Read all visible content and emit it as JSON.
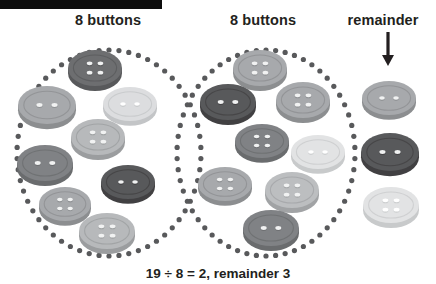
{
  "page": {
    "caption": "19 ÷ 8 = 2, remainder 3",
    "black_bar": "black-bar"
  },
  "headings": [
    {
      "label": "8 buttons",
      "name": "group-1-heading",
      "x": 45,
      "y": 12,
      "w": 126
    },
    {
      "label": "8 buttons",
      "name": "group-2-heading",
      "x": 200,
      "y": 12,
      "w": 126
    },
    {
      "label": "remainder",
      "name": "remainder-heading",
      "x": 330,
      "y": 12,
      "w": 106
    }
  ],
  "groups": [
    {
      "name": "group-1-circle",
      "label": "8 buttons",
      "count": 8,
      "ellipse": {
        "cx": 109,
        "cy": 153,
        "rx": 92,
        "ry": 103,
        "dots": 58,
        "dot_r": 2.6,
        "color": "#58595b"
      }
    },
    {
      "name": "group-2-circle",
      "label": "8 buttons",
      "count": 8,
      "ellipse": {
        "cx": 266,
        "cy": 153,
        "rx": 89,
        "ry": 103,
        "dots": 58,
        "dot_r": 2.6,
        "color": "#58595b"
      }
    }
  ],
  "remainder": {
    "label": "remainder",
    "count": 3,
    "arrow": {
      "x": 388,
      "y": 32,
      "length": 34,
      "color": "#231f20"
    }
  },
  "colors": {
    "ink": "#231f20",
    "dot": "#58595b",
    "background": "#ffffff",
    "bar": "#0d0d0d",
    "button_very_dark": "#58595b",
    "button_dark": "#6d6e70",
    "button_mid": "#808285",
    "button_light": "#a7a9ac",
    "button_lighter": "#bcbec0",
    "button_pale": "#d1d3d4",
    "button_palest": "#e6e7e8"
  },
  "buttons": [
    {
      "id": "b1",
      "group": "group-1",
      "holes": 4,
      "cx": 95,
      "cy": 68,
      "rx": 27,
      "ry": 18,
      "top": "#6d6e70",
      "side": "#58595b",
      "hole": "#f1f2f2"
    },
    {
      "id": "b2",
      "group": "group-1",
      "holes": 2,
      "cx": 47,
      "cy": 105,
      "rx": 29,
      "ry": 19,
      "top": "#a7a9ac",
      "side": "#8c8e90",
      "hole": "#f1f2f2"
    },
    {
      "id": "b3",
      "group": "group-1",
      "holes": 2,
      "cx": 130,
      "cy": 104,
      "rx": 27,
      "ry": 17,
      "top": "#dcdddf",
      "side": "#c3c5c7",
      "hole": "#ffffff"
    },
    {
      "id": "b4",
      "group": "group-1",
      "holes": 4,
      "cx": 98,
      "cy": 137,
      "rx": 27,
      "ry": 18,
      "top": "#b7b9bb",
      "side": "#9b9d9f",
      "hole": "#f1f2f2"
    },
    {
      "id": "b5",
      "group": "group-1",
      "holes": 2,
      "cx": 45,
      "cy": 163,
      "rx": 28,
      "ry": 18,
      "top": "#808285",
      "side": "#6a6c6e",
      "hole": "#f1f2f2"
    },
    {
      "id": "b6",
      "group": "group-1",
      "holes": 2,
      "cx": 128,
      "cy": 182,
      "rx": 27,
      "ry": 17,
      "top": "#58595b",
      "side": "#414042",
      "hole": "#f1f2f2"
    },
    {
      "id": "b7",
      "group": "group-1",
      "holes": 4,
      "cx": 65,
      "cy": 204,
      "rx": 26,
      "ry": 17,
      "top": "#a7a9ac",
      "side": "#8c8e90",
      "hole": "#f1f2f2"
    },
    {
      "id": "b8",
      "group": "group-1",
      "holes": 4,
      "cx": 107,
      "cy": 231,
      "rx": 28,
      "ry": 18,
      "top": "#b7b9bb",
      "side": "#9b9d9f",
      "hole": "#f1f2f2"
    },
    {
      "id": "b9",
      "group": "group-2",
      "holes": 4,
      "cx": 260,
      "cy": 68,
      "rx": 27,
      "ry": 18,
      "top": "#a7a9ac",
      "side": "#8c8e90",
      "hole": "#f1f2f2"
    },
    {
      "id": "b10",
      "group": "group-2",
      "holes": 2,
      "cx": 228,
      "cy": 102,
      "rx": 28,
      "ry": 18,
      "top": "#58595b",
      "side": "#414042",
      "hole": "#f1f2f2"
    },
    {
      "id": "b11",
      "group": "group-2",
      "holes": 4,
      "cx": 303,
      "cy": 100,
      "rx": 27,
      "ry": 18,
      "top": "#a7a9ac",
      "side": "#8c8e90",
      "hole": "#f1f2f2"
    },
    {
      "id": "b12",
      "group": "group-2",
      "holes": 4,
      "cx": 262,
      "cy": 141,
      "rx": 27,
      "ry": 17,
      "top": "#808285",
      "side": "#6a6c6e",
      "hole": "#f1f2f2"
    },
    {
      "id": "b13",
      "group": "group-2",
      "holes": 2,
      "cx": 318,
      "cy": 152,
      "rx": 27,
      "ry": 17,
      "top": "#e2e3e4",
      "side": "#c8cacb",
      "hole": "#ffffff"
    },
    {
      "id": "b14",
      "group": "group-2",
      "holes": 4,
      "cx": 225,
      "cy": 184,
      "rx": 27,
      "ry": 17,
      "top": "#a7a9ac",
      "side": "#8c8e90",
      "hole": "#f1f2f2"
    },
    {
      "id": "b15",
      "group": "group-2",
      "holes": 4,
      "cx": 292,
      "cy": 190,
      "rx": 27,
      "ry": 18,
      "top": "#bcbec0",
      "side": "#a1a3a5",
      "hole": "#f1f2f2"
    },
    {
      "id": "b16",
      "group": "group-2",
      "holes": 2,
      "cx": 271,
      "cy": 228,
      "rx": 28,
      "ry": 18,
      "top": "#808285",
      "side": "#6a6c6e",
      "hole": "#f1f2f2"
    },
    {
      "id": "b17",
      "group": "remainder",
      "holes": 2,
      "cx": 389,
      "cy": 98,
      "rx": 27,
      "ry": 17,
      "top": "#a7a9ac",
      "side": "#8c8e90",
      "hole": "#f1f2f2"
    },
    {
      "id": "b18",
      "group": "remainder",
      "holes": 2,
      "cx": 390,
      "cy": 152,
      "rx": 29,
      "ry": 19,
      "top": "#58595b",
      "side": "#414042",
      "hole": "#f1f2f2"
    },
    {
      "id": "b19",
      "group": "remainder",
      "holes": 4,
      "cx": 391,
      "cy": 205,
      "rx": 28,
      "ry": 18,
      "top": "#e2e3e4",
      "side": "#c8cacb",
      "hole": "#ffffff"
    }
  ]
}
